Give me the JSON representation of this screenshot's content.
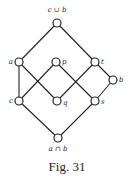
{
  "caption": "Fig. 31",
  "nodes": [
    {
      "id": "top",
      "label": "c ∪ b",
      "x": 57,
      "y": 23
    },
    {
      "id": "a",
      "label": "a",
      "x": 19,
      "y": 62
    },
    {
      "id": "p",
      "label": "p",
      "x": 56,
      "y": 62
    },
    {
      "id": "t",
      "label": "t",
      "x": 95,
      "y": 62
    },
    {
      "id": "b",
      "label": "b",
      "x": 113,
      "y": 80
    },
    {
      "id": "c",
      "label": "c",
      "x": 19,
      "y": 101
    },
    {
      "id": "q",
      "label": "q",
      "x": 57,
      "y": 101
    },
    {
      "id": "s",
      "label": "s",
      "x": 95,
      "y": 101
    },
    {
      "id": "bottom",
      "label": "a ∩ b",
      "x": 58,
      "y": 138
    }
  ],
  "edges": [
    [
      "top",
      "a"
    ],
    [
      "top",
      "t"
    ],
    [
      "a",
      "c"
    ],
    [
      "a",
      "q"
    ],
    [
      "p",
      "c"
    ],
    [
      "p",
      "s"
    ],
    [
      "t",
      "q"
    ],
    [
      "t",
      "b"
    ],
    [
      "b",
      "s"
    ],
    [
      "c",
      "bottom"
    ],
    [
      "s",
      "bottom"
    ]
  ],
  "labels": {
    "top": "c ∪ b",
    "a": "a",
    "p": "p",
    "t": "t",
    "b": "b",
    "c": "c",
    "q": "q",
    "s": "s",
    "bottom": "a ∩ b"
  }
}
